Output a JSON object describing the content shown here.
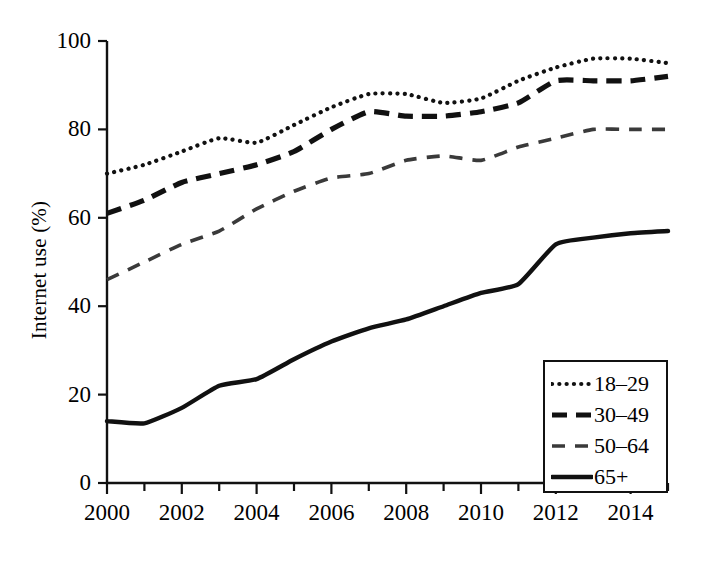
{
  "chart_data": {
    "type": "line",
    "title": "",
    "xlabel": "",
    "ylabel": "Internet use (%)",
    "xlim": [
      2000,
      2015
    ],
    "ylim": [
      0,
      100
    ],
    "grid": false,
    "legend_position": "bottom-right",
    "x": [
      2000,
      2001,
      2002,
      2003,
      2004,
      2005,
      2006,
      2007,
      2008,
      2009,
      2010,
      2011,
      2012,
      2013,
      2014,
      2015
    ],
    "xtick_labels": [
      "2000",
      "2002",
      "2004",
      "2006",
      "2008",
      "2010",
      "2012",
      "2014"
    ],
    "xtick_values": [
      2000,
      2002,
      2004,
      2006,
      2008,
      2010,
      2012,
      2014
    ],
    "ytick_labels": [
      "0",
      "20",
      "40",
      "60",
      "80",
      "100"
    ],
    "ytick_values": [
      0,
      20,
      40,
      60,
      80,
      100
    ],
    "series": [
      {
        "name": "18–29",
        "style": "dotted",
        "color": "#111111",
        "values": [
          70,
          72,
          75,
          78,
          77,
          81,
          85,
          88,
          88,
          86,
          87,
          91,
          94,
          96,
          96,
          95
        ]
      },
      {
        "name": "30–49",
        "style": "dashed-thick",
        "color": "#111111",
        "values": [
          61,
          64,
          68,
          70,
          72,
          75,
          80,
          84,
          83,
          83,
          84,
          86,
          91,
          91,
          91,
          92
        ]
      },
      {
        "name": "50–64",
        "style": "dashed-thin",
        "color": "#444444",
        "values": [
          46,
          50,
          54,
          57,
          62,
          66,
          69,
          70,
          73,
          74,
          73,
          76,
          78,
          80,
          80,
          80
        ]
      },
      {
        "name": "65+",
        "style": "solid",
        "color": "#111111",
        "values": [
          14,
          13.5,
          17,
          22,
          23.5,
          28,
          32,
          35,
          37,
          40,
          43,
          45,
          54,
          55.5,
          56.5,
          57
        ]
      }
    ]
  },
  "legend": {
    "items": [
      {
        "label": "18–29",
        "style": "dotted"
      },
      {
        "label": "30–49",
        "style": "dashed-thick"
      },
      {
        "label": "50–64",
        "style": "dashed-thin"
      },
      {
        "label": "65+",
        "style": "solid"
      }
    ]
  }
}
